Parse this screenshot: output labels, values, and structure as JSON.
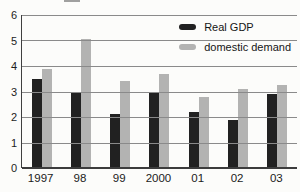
{
  "chart_data": {
    "type": "bar",
    "title": "",
    "categories": [
      "1997",
      "98",
      "99",
      "2000",
      "01",
      "02",
      "03"
    ],
    "series": [
      {
        "name": "Real GDP",
        "color": "#212121",
        "values": [
          3.5,
          2.95,
          2.1,
          3.0,
          2.2,
          1.9,
          2.9
        ]
      },
      {
        "name": "domestic demand",
        "color": "#b3b3b2",
        "values": [
          3.9,
          5.05,
          3.4,
          3.7,
          2.8,
          3.1,
          3.25
        ]
      }
    ],
    "xlabel": "",
    "ylabel": "",
    "ylim": [
      0,
      6
    ],
    "yticks": [
      0,
      1,
      2,
      3,
      4,
      5,
      6
    ],
    "grid": true,
    "legend_position": "top-right"
  },
  "colors": {
    "background": "#fcfcfa",
    "gridline": "#8a8a8a",
    "axis": "#3c3c3c",
    "tick_text": "#1d1d1d"
  }
}
